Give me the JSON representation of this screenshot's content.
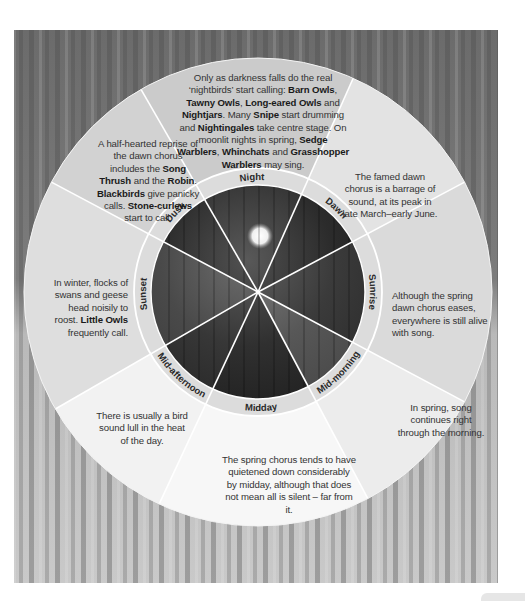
{
  "diagram": {
    "center": {
      "x": 258,
      "y": 292
    },
    "radii": {
      "outer": 234,
      "label_ring_outer": 124,
      "photo": 107
    },
    "colors": {
      "background_forest_dark": "#5a5a5a",
      "background_forest_light": "#cfcfcf",
      "text": "#333333",
      "bold_text": "#1a1a1a",
      "divider": "#ffffff"
    },
    "segments": [
      {
        "id": "night",
        "label": "Night",
        "start_angle": -30,
        "end_angle": 24,
        "fill": "#cbcbcb",
        "parts": [
          {
            "t": "Only as darkness falls do the real ‘nightbirds’ start calling: "
          },
          {
            "t": "Barn Owls",
            "b": true
          },
          {
            "t": ", "
          },
          {
            "t": "Tawny Owls",
            "b": true
          },
          {
            "t": ", "
          },
          {
            "t": "Long-eared Owls",
            "b": true
          },
          {
            "t": " and "
          },
          {
            "t": "Nightjars",
            "b": true
          },
          {
            "t": ". Many "
          },
          {
            "t": "Snipe",
            "b": true
          },
          {
            "t": " start drumming and "
          },
          {
            "t": "Nightingales",
            "b": true
          },
          {
            "t": " take centre stage. On moonlit nights in spring, "
          },
          {
            "t": "Sedge Warblers",
            "b": true
          },
          {
            "t": ", "
          },
          {
            "t": "Whinchats",
            "b": true
          },
          {
            "t": " and "
          },
          {
            "t": "Grasshopper Warblers",
            "b": true
          },
          {
            "t": " may sing."
          }
        ]
      },
      {
        "id": "dawn",
        "label": "Dawn",
        "start_angle": 24,
        "end_angle": 62,
        "fill": "#e3e3e3",
        "parts": [
          {
            "t": "The famed dawn chorus is a barrage of sound, at its peak in late March–early June."
          }
        ]
      },
      {
        "id": "sunrise",
        "label": "Sunrise",
        "start_angle": 62,
        "end_angle": 118,
        "fill": "#dadada",
        "parts": [
          {
            "t": "Although the spring dawn chorus eases, everywhere is still alive with song."
          }
        ]
      },
      {
        "id": "mid-morning",
        "label": "Mid-morning",
        "start_angle": 118,
        "end_angle": 152,
        "fill": "#ececec",
        "parts": [
          {
            "t": "In spring, song continues right through the morning."
          }
        ]
      },
      {
        "id": "midday",
        "label": "Midday",
        "start_angle": 152,
        "end_angle": 205,
        "fill": "#f7f7f7",
        "parts": [
          {
            "t": "The spring chorus tends to have quietened down considerably by midday, although that does not mean all is silent – far from it."
          }
        ]
      },
      {
        "id": "mid-afternoon",
        "label": "Mid-afternoon",
        "start_angle": 205,
        "end_angle": 240,
        "fill": "#f2f2f2",
        "parts": [
          {
            "t": "There is usually a bird sound lull in the heat of the day."
          }
        ]
      },
      {
        "id": "sunset",
        "label": "Sunset",
        "start_angle": 240,
        "end_angle": 298,
        "fill": "#dedede",
        "parts": [
          {
            "t": "In winter, flocks of swans and geese head noisily to roost. "
          },
          {
            "t": "Little Owls",
            "b": true
          },
          {
            "t": " frequently call."
          }
        ]
      },
      {
        "id": "dusk",
        "label": "Dusk",
        "start_angle": 298,
        "end_angle": 330,
        "fill": "#d2d2d2",
        "parts": [
          {
            "t": "A half-hearted reprise of the dawn chorus includes the "
          },
          {
            "t": "Song Thrush",
            "b": true
          },
          {
            "t": " and the "
          },
          {
            "t": "Robin",
            "b": true
          },
          {
            "t": ". "
          },
          {
            "t": "Blackbirds",
            "b": true
          },
          {
            "t": " give panicky calls. "
          },
          {
            "t": "Stone-curlews",
            "b": true
          },
          {
            "t": " start to call."
          }
        ]
      }
    ]
  }
}
